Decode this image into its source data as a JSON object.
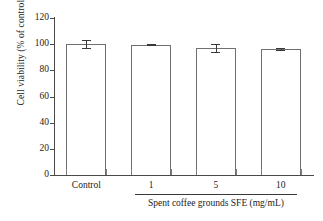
{
  "chart_data": {
    "type": "bar",
    "title": "",
    "subtitle": "",
    "xlabel": "Spent coffee grounds SFE (mg/mL)",
    "ylabel": "Cell viability (% of control)",
    "categories": [
      "Control",
      "1",
      "5",
      "10"
    ],
    "values": [
      100,
      99.5,
      97,
      96
    ],
    "errors": [
      3.2,
      0.5,
      3.0,
      0.7
    ],
    "series": [
      {
        "name": "Cell viability",
        "values": [
          100,
          99.5,
          97,
          96
        ],
        "errors": [
          3.2,
          0.5,
          3.0,
          0.7
        ]
      }
    ],
    "ylim": [
      0,
      120
    ],
    "ytick_values": [
      0,
      20,
      40,
      60,
      80,
      100,
      120
    ],
    "ytick_labels": [
      "0",
      "20",
      "40",
      "60",
      "80",
      "100",
      "120"
    ],
    "grid": false,
    "legend": false,
    "legend_position": "none",
    "bar_fill_color": "#ffffff",
    "bar_edge_color": "#6f6f6f",
    "axis_color": "#4a4a4a",
    "error_bar_color": "#3a3a3a",
    "text_color": "#1b1b1b",
    "background_color": "#ffffff",
    "annotations": {
      "group_bracket_label": "Spent coffee grounds SFE (mg/mL)",
      "group_bracket_categories": [
        "1",
        "5",
        "10"
      ]
    }
  }
}
